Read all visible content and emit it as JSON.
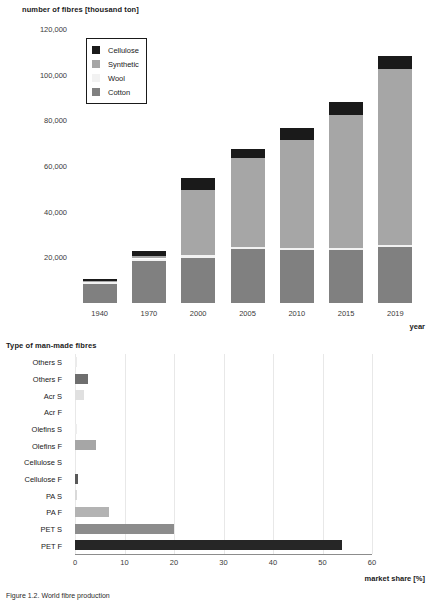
{
  "figure": {
    "caption": "Figure 1.2. World fibre production"
  },
  "chart_data": [
    {
      "type": "bar",
      "stacked": true,
      "title": "",
      "ylabel": "number of fibres [thousand ton]",
      "xlabel": "year",
      "categories": [
        "1940",
        "1970",
        "2000",
        "2005",
        "2010",
        "2015",
        "2019"
      ],
      "ylim": [
        0,
        120000
      ],
      "yticks": [
        20000,
        40000,
        60000,
        80000,
        100000,
        120000
      ],
      "ytick_labels": [
        "20,000",
        "40,000",
        "60,000",
        "80,000",
        "100,000",
        "120,000"
      ],
      "grid": false,
      "legend_position": "upper-left-inset",
      "series": [
        {
          "name": "Cotton",
          "color": "#808080",
          "values": [
            8200,
            18200,
            19800,
            23500,
            23000,
            23000,
            24500
          ]
        },
        {
          "name": "Wool",
          "color": "#f2f2f2",
          "values": [
            1100,
            1300,
            1300,
            1200,
            1200,
            1150,
            1100
          ]
        },
        {
          "name": "Synthetic",
          "color": "#a6a6a6",
          "values": [
            300,
            1000,
            28500,
            39000,
            47000,
            58000,
            77000
          ]
        },
        {
          "name": "Cellulose",
          "color": "#1a1a1a",
          "values": [
            900,
            2100,
            5000,
            3800,
            5500,
            6000,
            5500
          ]
        }
      ],
      "totals": [
        10500,
        22600,
        54600,
        67500,
        76700,
        88150,
        108100
      ]
    },
    {
      "type": "bar",
      "orientation": "horizontal",
      "title": "Type of man-made fibres",
      "xlabel": "market share [%]",
      "ylabel": "",
      "xlim": [
        0,
        60
      ],
      "xticks": [
        0,
        10,
        20,
        30,
        40,
        50,
        60
      ],
      "xtick_labels": [
        "0",
        "10",
        "20",
        "30",
        "40",
        "50",
        "60"
      ],
      "grid": true,
      "categories": [
        "PET F",
        "PET S",
        "PA F",
        "PA S",
        "Cellulose F",
        "Cellulose S",
        "Olefins F",
        "Olefins S",
        "Acr F",
        "Acr S",
        "Others F",
        "Others S"
      ],
      "values": [
        54.0,
        20.0,
        6.9,
        0.4,
        0.6,
        0.0,
        4.2,
        0.5,
        0.0,
        1.9,
        2.6,
        0.4
      ],
      "colors": [
        "#262626",
        "#8c8c8c",
        "#b3b3b3",
        "#d9d9d9",
        "#595959",
        "#f2f2f2",
        "#a6a6a6",
        "#ededed",
        "#ffffff",
        "#e0e0e0",
        "#6e6e6e",
        "#ebebeb"
      ]
    }
  ]
}
